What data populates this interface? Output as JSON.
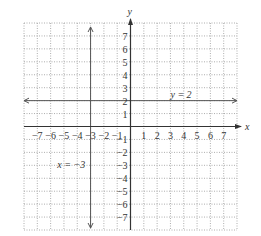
{
  "chart_data": {
    "type": "line",
    "title": "",
    "xlabel": "x",
    "ylabel": "y",
    "xlim": [
      -8,
      8
    ],
    "ylim": [
      -8,
      8
    ],
    "grid": true,
    "grid_style": "dotted",
    "x_ticks": [
      -7,
      -6,
      -5,
      -4,
      -3,
      -2,
      -1,
      1,
      2,
      3,
      4,
      5,
      6,
      7
    ],
    "y_ticks": [
      7,
      6,
      5,
      4,
      3,
      2,
      1,
      -1,
      -2,
      -3,
      -4,
      -5,
      -6,
      -7
    ],
    "series": [
      {
        "name": "y = 2",
        "kind": "horizontal",
        "value": 2,
        "label_pos": [
          3,
          2.4
        ]
      },
      {
        "name": "x = −3",
        "kind": "vertical",
        "value": -3,
        "label_pos": [
          -5.5,
          -3
        ]
      }
    ],
    "annotations": [
      "y = 2",
      "x = −3"
    ],
    "colors": {
      "axis": "#333333",
      "line": "#555555",
      "grid": "#999999"
    }
  }
}
